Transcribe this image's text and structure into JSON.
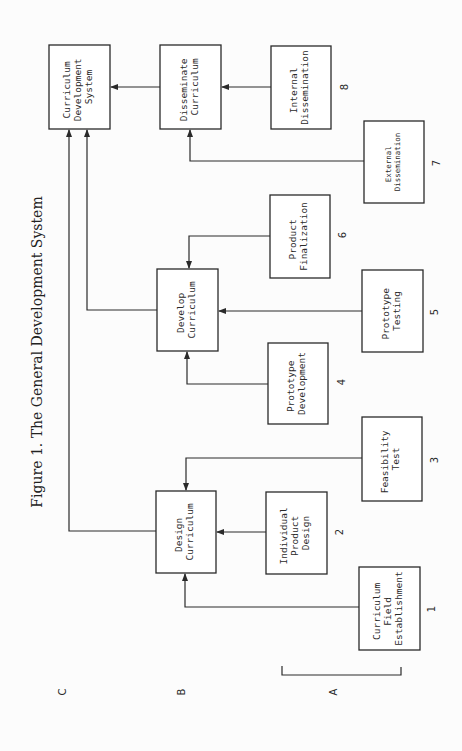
{
  "figure": {
    "title": "Figure 1. The General Development System"
  },
  "boxes": {
    "cds": {
      "lines": [
        "Curriculum",
        "Development",
        "System"
      ]
    },
    "disseminate": {
      "lines": [
        "Disseminate",
        "Curriculum"
      ]
    },
    "internal": {
      "lines": [
        "Internal",
        "Dissemination"
      ],
      "number": "8"
    },
    "external": {
      "lines": [
        "External",
        "Dissemination"
      ],
      "number": "7"
    },
    "finalization": {
      "lines": [
        "Product",
        "Finalization"
      ],
      "number": "6"
    },
    "develop": {
      "lines": [
        "Develop",
        "Curriculum"
      ]
    },
    "testing": {
      "lines": [
        "Prototype",
        "Testing"
      ],
      "number": "5"
    },
    "protodev": {
      "lines": [
        "Prototype",
        "Development"
      ],
      "number": "4"
    },
    "feasibility": {
      "lines": [
        "Feasibility",
        "Test"
      ],
      "number": "3"
    },
    "design": {
      "lines": [
        "Design",
        "Curriculum"
      ]
    },
    "individual": {
      "lines": [
        "Individual",
        "Product",
        "Design"
      ],
      "number": "2"
    },
    "field": {
      "lines": [
        "Curriculum",
        "Field",
        "Establishment"
      ],
      "number": "1"
    }
  },
  "levels": {
    "c": "C",
    "b": "B",
    "a": "A"
  }
}
